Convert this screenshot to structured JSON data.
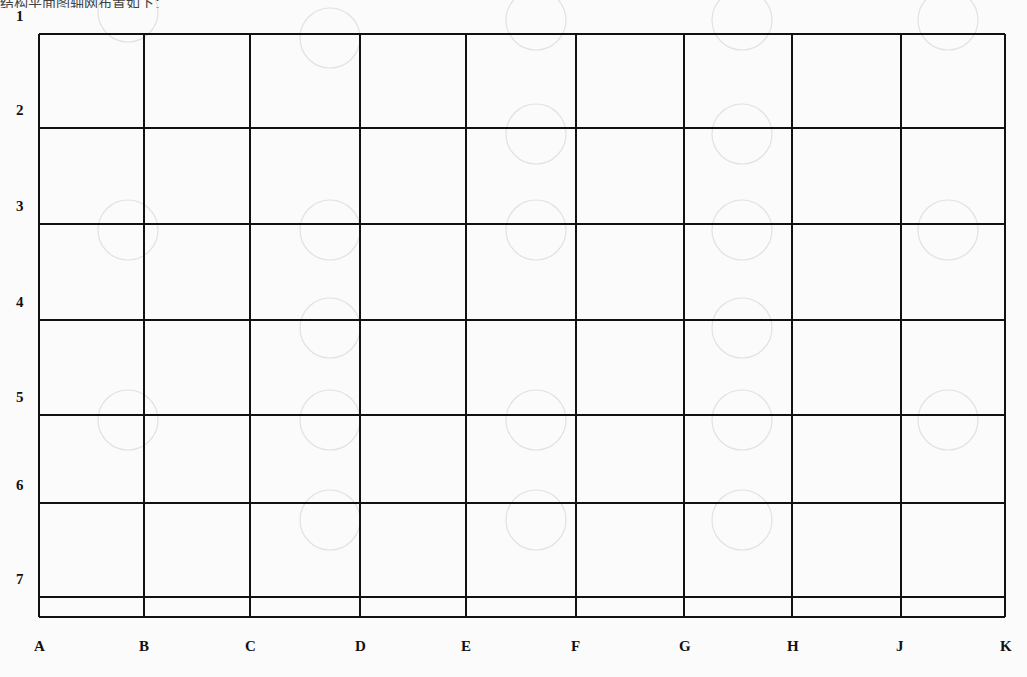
{
  "header": {
    "ghost_text": "结构平面图轴网布置如下："
  },
  "grid": {
    "line_color": "#111111",
    "background_color": "#fbfbfb",
    "columns": [
      {
        "label": "A",
        "x": 39
      },
      {
        "label": "B",
        "x": 144
      },
      {
        "label": "C",
        "x": 250
      },
      {
        "label": "D",
        "x": 360
      },
      {
        "label": "E",
        "x": 466
      },
      {
        "label": "F",
        "x": 576
      },
      {
        "label": "G",
        "x": 684
      },
      {
        "label": "H",
        "x": 792
      },
      {
        "label": "J",
        "x": 901
      },
      {
        "label": "K",
        "x": 1005
      }
    ],
    "rows": [
      {
        "label": "1",
        "y": 34
      },
      {
        "label": "2",
        "y": 128
      },
      {
        "label": "3",
        "y": 224
      },
      {
        "label": "4",
        "y": 320
      },
      {
        "label": "5",
        "y": 415
      },
      {
        "label": "6",
        "y": 503
      },
      {
        "label": "7",
        "y": 597
      }
    ],
    "bottom_edge_y": 617
  }
}
